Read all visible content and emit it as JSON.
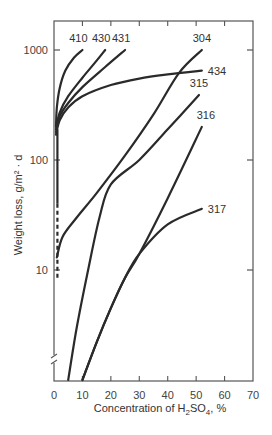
{
  "chart_data": {
    "type": "line",
    "title": "",
    "xlabel": "Concentration of H2SO4, %",
    "xlabel_parts": {
      "pre": "Concentration of H",
      "sub1": "2",
      "mid": "SO",
      "sub2": "4",
      "post": ", %"
    },
    "ylabel": "Weight loss, g/m² · d",
    "xlim": [
      0,
      70
    ],
    "ylim_log": [
      1,
      1800
    ],
    "yscale": "log",
    "x_ticks": [
      0,
      10,
      20,
      30,
      40,
      50,
      60,
      70
    ],
    "y_ticks": [
      10,
      100,
      1000
    ],
    "y_tick_labels": [
      "10",
      "100",
      "1000"
    ],
    "grid": false,
    "legend": "inline labels at curve ends",
    "series": [
      {
        "name": "410",
        "x": [
          0.7,
          1,
          2,
          4,
          7,
          10
        ],
        "y": [
          200,
          300,
          450,
          650,
          850,
          1000
        ]
      },
      {
        "name": "430",
        "x": [
          0.7,
          2,
          5,
          10,
          15,
          18
        ],
        "y": [
          190,
          270,
          380,
          560,
          800,
          1000
        ]
      },
      {
        "name": "431",
        "x": [
          0.7,
          2,
          5,
          10,
          18,
          25
        ],
        "y": [
          180,
          250,
          330,
          460,
          700,
          1000
        ]
      },
      {
        "name": "434",
        "x": [
          0.7,
          2,
          5,
          10,
          20,
          30,
          40,
          52
        ],
        "y": [
          170,
          230,
          300,
          380,
          480,
          550,
          600,
          650
        ]
      },
      {
        "name": "304",
        "x": [
          1,
          3,
          8,
          15,
          25,
          35,
          44,
          52
        ],
        "y": [
          13,
          20,
          30,
          50,
          110,
          260,
          620,
          1000
        ]
      },
      {
        "name": "315",
        "x": [
          5,
          8,
          12,
          16,
          20,
          30,
          40,
          51
        ],
        "y": [
          1,
          3,
          10,
          30,
          60,
          100,
          190,
          390
        ]
      },
      {
        "name": "316",
        "x": [
          10,
          15,
          20,
          25,
          30,
          40,
          52
        ],
        "y": [
          1,
          2.2,
          4.5,
          8.5,
          14,
          45,
          200
        ]
      },
      {
        "name": "317",
        "x": [
          10,
          15,
          20,
          25,
          30,
          40,
          52
        ],
        "y": [
          1,
          2.2,
          4.5,
          8.5,
          14,
          26,
          36
        ]
      }
    ],
    "annotations": [
      {
        "type": "dashed-line",
        "x": 1.2,
        "y_from": 8,
        "y_to": 40,
        "note": "dashed vertical segment near x≈1%"
      },
      {
        "type": "axis-break",
        "axis": "y",
        "near": "bottom"
      }
    ]
  }
}
